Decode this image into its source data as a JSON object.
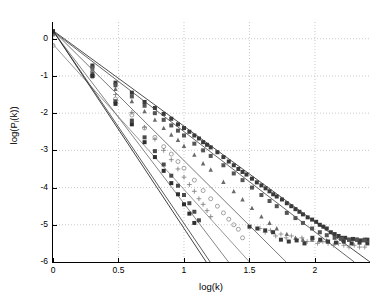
{
  "figure": {
    "background": "#ffffff",
    "axis_color": "#000000",
    "grid_color": "#b0b0b0"
  },
  "chart_data": {
    "type": "scatter",
    "title": "",
    "subtitle": "",
    "xlabel": "log(k)",
    "ylabel_text": "log(P",
    "ylabel_sub": "i",
    "ylabel_tail": "(k))",
    "ylabel": "log(P_i(k))",
    "xlim": [
      0,
      2.42
    ],
    "ylim": [
      -6,
      0.45
    ],
    "xticks": [
      0,
      0.5,
      1,
      1.5,
      2
    ],
    "xtick_labels": [
      "0",
      "0.5",
      "1",
      "1.5",
      "2"
    ],
    "yticks": [
      0,
      -1,
      -2,
      -3,
      -4,
      -5,
      -6
    ],
    "ytick_labels": [
      "0",
      "-1",
      "-2",
      "-3",
      "-4",
      "-5",
      "-6"
    ],
    "grid": true,
    "grid_style": "dotted",
    "legend": null,
    "legend_position": "none",
    "series": [
      {
        "name": "series-1-square-dark",
        "marker": "square-filled",
        "color": "#3a3a3a",
        "fit_line": {
          "x0": 0.0,
          "y0": 0.22,
          "x1": 2.42,
          "y1": -6.0,
          "slope": -2.57
        },
        "x": [
          0.0,
          0.301,
          0.477,
          0.602,
          0.699,
          0.778,
          0.845,
          0.903,
          0.954,
          1.0,
          1.041,
          1.079,
          1.114,
          1.146,
          1.176,
          1.204,
          1.255,
          1.301,
          1.342,
          1.38,
          1.415,
          1.447,
          1.477,
          1.519,
          1.556,
          1.591,
          1.623,
          1.653,
          1.681,
          1.708,
          1.748,
          1.785,
          1.819,
          1.851,
          1.881,
          1.908,
          1.944,
          1.978,
          2.009,
          2.037,
          2.064,
          2.09,
          2.121,
          2.15,
          2.18,
          2.2,
          2.23,
          2.26,
          2.29,
          2.32,
          2.35,
          2.38,
          2.4
        ],
        "y": [
          0.2,
          -0.72,
          -1.18,
          -1.45,
          -1.7,
          -1.86,
          -2.02,
          -2.15,
          -2.3,
          -2.4,
          -2.5,
          -2.6,
          -2.68,
          -2.78,
          -2.85,
          -2.92,
          -3.05,
          -3.18,
          -3.3,
          -3.4,
          -3.5,
          -3.58,
          -3.65,
          -3.76,
          -3.86,
          -3.94,
          -4.02,
          -4.1,
          -4.18,
          -4.24,
          -4.32,
          -4.42,
          -4.5,
          -4.58,
          -4.65,
          -4.72,
          -4.8,
          -4.86,
          -4.92,
          -5.0,
          -5.05,
          -5.1,
          -5.2,
          -5.25,
          -5.3,
          -5.35,
          -5.35,
          -5.4,
          -5.38,
          -5.4,
          -5.42,
          -5.4,
          -5.4
        ]
      },
      {
        "name": "series-2-square-mid",
        "marker": "square-filled",
        "color": "#555555",
        "fit_line": {
          "x0": 0.0,
          "y0": 0.2,
          "x1": 2.3,
          "y1": -6.0,
          "slope": -2.7
        },
        "x": [
          0.0,
          0.301,
          0.477,
          0.602,
          0.699,
          0.778,
          0.845,
          0.903,
          0.954,
          1.0,
          1.079,
          1.146,
          1.204,
          1.301,
          1.38,
          1.447,
          1.519,
          1.591,
          1.653,
          1.708,
          1.785,
          1.851,
          1.908,
          1.978,
          2.037,
          2.09,
          2.15,
          2.2,
          2.26,
          2.32,
          2.38
        ],
        "y": [
          0.15,
          -0.78,
          -1.25,
          -1.55,
          -1.8,
          -2.0,
          -2.18,
          -2.33,
          -2.47,
          -2.6,
          -2.82,
          -3.0,
          -3.15,
          -3.4,
          -3.62,
          -3.8,
          -4.0,
          -4.2,
          -4.36,
          -4.5,
          -4.68,
          -4.82,
          -4.95,
          -5.1,
          -5.2,
          -5.28,
          -5.35,
          -5.38,
          -5.4,
          -5.4,
          -5.42
        ]
      },
      {
        "name": "series-3-triangle",
        "marker": "triangle-filled",
        "color": "#6a6a6a",
        "fit_line": {
          "x0": 0.0,
          "y0": 0.22,
          "x1": 1.78,
          "y1": -6.0,
          "slope": -3.5
        },
        "x": [
          0.0,
          0.301,
          0.477,
          0.602,
          0.699,
          0.778,
          0.845,
          0.903,
          0.954,
          1.0,
          1.079,
          1.146,
          1.204,
          1.301,
          1.38,
          1.447,
          1.519,
          1.591,
          1.653,
          1.708,
          1.785,
          1.851,
          1.908,
          1.978,
          2.037,
          2.09
        ],
        "y": [
          0.12,
          -0.82,
          -1.35,
          -1.68,
          -1.95,
          -2.18,
          -2.4,
          -2.58,
          -2.72,
          -2.88,
          -3.12,
          -3.35,
          -3.52,
          -3.85,
          -4.1,
          -4.32,
          -4.55,
          -4.78,
          -4.95,
          -5.1,
          -5.25,
          -5.35,
          -5.4,
          -5.4,
          -5.42,
          -5.42
        ]
      },
      {
        "name": "series-4-circle-open",
        "marker": "circle-open",
        "color": "#8a8a8a",
        "fit_line": {
          "x0": 0.0,
          "y0": -0.15,
          "x1": 1.5,
          "y1": -6.0,
          "slope": -3.9
        },
        "x": [
          0.0,
          0.301,
          0.477,
          0.602,
          0.699,
          0.778,
          0.845,
          0.903,
          0.954,
          1.0,
          1.079,
          1.146,
          1.204,
          1.255,
          1.301,
          1.342,
          1.38,
          1.415,
          1.447
        ],
        "y": [
          -0.18,
          -1.02,
          -1.62,
          -2.05,
          -2.4,
          -2.65,
          -2.9,
          -3.1,
          -3.3,
          -3.48,
          -3.8,
          -4.08,
          -4.3,
          -4.5,
          -4.68,
          -4.85,
          -5.0,
          -5.12,
          -5.35
        ]
      },
      {
        "name": "series-5-plus",
        "marker": "plus",
        "color": "#777777",
        "fit_line": {
          "x0": 0.0,
          "y0": 0.2,
          "x1": 1.34,
          "y1": -6.0,
          "slope": -4.62
        },
        "x": [
          0.0,
          0.301,
          0.477,
          0.602,
          0.699,
          0.778,
          0.845,
          0.903,
          0.954,
          1.0,
          1.041,
          1.079,
          1.114,
          1.146,
          1.176,
          1.204
        ],
        "y": [
          0.1,
          -0.88,
          -1.5,
          -1.98,
          -2.38,
          -2.7,
          -3.0,
          -3.25,
          -3.5,
          -3.72,
          -3.92,
          -4.1,
          -4.3,
          -4.45,
          -4.62,
          -4.78
        ]
      },
      {
        "name": "series-6-square-steep",
        "marker": "square-filled",
        "color": "#4a4a4a",
        "fit_line": {
          "x0": 0.0,
          "y0": 0.22,
          "x1": 1.2,
          "y1": -6.0,
          "slope": -5.18
        },
        "x": [
          0.0,
          0.301,
          0.477,
          0.602,
          0.699,
          0.778,
          0.845,
          0.903,
          0.954,
          1.0,
          1.041,
          1.079,
          1.114
        ],
        "y": [
          0.18,
          -0.95,
          -1.68,
          -2.2,
          -2.65,
          -3.02,
          -3.38,
          -3.68,
          -3.95,
          -4.2,
          -4.42,
          -4.65,
          -4.88
        ]
      },
      {
        "name": "series-7-square-steepest",
        "marker": "square-filled",
        "color": "#2e2e2e",
        "fit_line": {
          "x0": 0.0,
          "y0": 0.22,
          "x1": 1.17,
          "y1": -6.0,
          "slope": -5.32
        },
        "x": [
          0.0,
          0.301,
          0.477,
          0.602,
          0.699,
          0.778,
          0.845,
          0.903,
          0.954,
          1.0,
          1.041,
          1.079
        ],
        "y": [
          0.2,
          -1.0,
          -1.75,
          -2.3,
          -2.78,
          -3.18,
          -3.55,
          -3.88,
          -4.18,
          -4.45,
          -4.7,
          -4.95
        ]
      },
      {
        "name": "series-8-tail-plus-scatter",
        "marker": "plus",
        "color": "#808080",
        "fit_line": null,
        "x": [
          1.58,
          1.62,
          1.66,
          1.7,
          1.74,
          1.78,
          1.82,
          1.86,
          1.9,
          1.94,
          1.98,
          2.02,
          2.06,
          2.1,
          2.14,
          2.18,
          2.22,
          2.26,
          2.3,
          2.34,
          2.38
        ],
        "y": [
          -5.1,
          -5.2,
          -5.15,
          -5.3,
          -5.25,
          -5.35,
          -5.3,
          -5.4,
          -5.35,
          -5.45,
          -5.4,
          -5.5,
          -5.45,
          -5.5,
          -5.55,
          -5.5,
          -5.55,
          -5.6,
          -5.55,
          -5.6,
          -5.6
        ]
      },
      {
        "name": "series-9-tail-square-scatter",
        "marker": "square-filled",
        "color": "#3a3a3a",
        "fit_line": null,
        "x": [
          1.5,
          1.56,
          1.62,
          1.68,
          1.74,
          1.8,
          1.86,
          1.92,
          1.98,
          2.04,
          2.1,
          2.16,
          2.22,
          2.28,
          2.34,
          2.4
        ],
        "y": [
          -5.05,
          -5.1,
          -5.15,
          -5.2,
          -5.4,
          -5.45,
          -5.42,
          -5.5,
          -5.35,
          -5.4,
          -5.45,
          -5.48,
          -5.45,
          -5.5,
          -5.48,
          -5.5
        ]
      }
    ]
  }
}
